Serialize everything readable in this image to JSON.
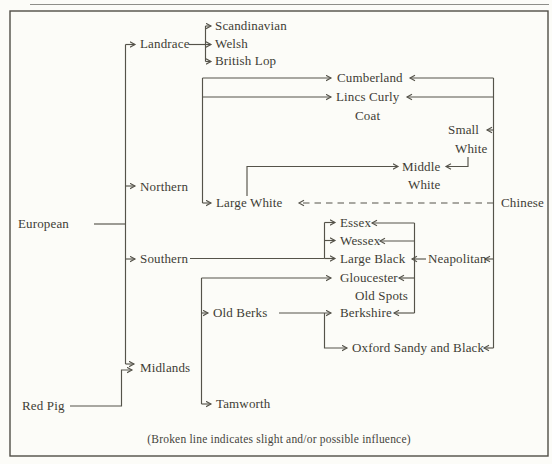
{
  "figure": {
    "caption": "(Broken line indicates slight and/or possible influence)",
    "background_color": "#fcfcf8",
    "ink_color": "#3e3d35",
    "line_color": "#55534a"
  },
  "nodes": {
    "european": {
      "label": "European"
    },
    "red_pig": {
      "label": "Red Pig"
    },
    "landrace": {
      "label": "Landrace"
    },
    "scandinavian": {
      "label": "Scandinavian"
    },
    "welsh": {
      "label": "Welsh"
    },
    "british_lop": {
      "label": "British Lop"
    },
    "northern": {
      "label": "Northern"
    },
    "southern": {
      "label": "Southern"
    },
    "midlands": {
      "label": "Midlands"
    },
    "cumberland": {
      "label": "Cumberland"
    },
    "lincs_curly_coat": {
      "line1": "Lincs Curly",
      "line2": "Coat"
    },
    "small_white": {
      "line1": "Small",
      "line2": "White"
    },
    "middle_white": {
      "line1": "Middle",
      "line2": "White"
    },
    "large_white": {
      "label": "Large White"
    },
    "chinese": {
      "label": "Chinese"
    },
    "essex": {
      "label": "Essex"
    },
    "wessex": {
      "label": "Wessex"
    },
    "large_black": {
      "label": "Large Black"
    },
    "neapolitan": {
      "label": "Neapolitan"
    },
    "gloucester_old_spots": {
      "line1": "Gloucester",
      "line2": "Old Spots"
    },
    "old_berks": {
      "label": "Old Berks"
    },
    "berkshire": {
      "label": "Berkshire"
    },
    "oxford_sandy_and_black": {
      "label": "Oxford Sandy and Black"
    },
    "tamworth": {
      "label": "Tamworth"
    }
  },
  "edges": [
    {
      "from": "european",
      "to": "landrace",
      "style": "solid"
    },
    {
      "from": "european",
      "to": "northern",
      "style": "solid"
    },
    {
      "from": "european",
      "to": "southern",
      "style": "solid"
    },
    {
      "from": "european",
      "to": "midlands",
      "style": "solid"
    },
    {
      "from": "red_pig",
      "to": "midlands",
      "style": "solid"
    },
    {
      "from": "landrace",
      "to": "scandinavian",
      "style": "solid"
    },
    {
      "from": "landrace",
      "to": "welsh",
      "style": "solid"
    },
    {
      "from": "landrace",
      "to": "british_lop",
      "style": "solid"
    },
    {
      "from": "northern",
      "to": "cumberland",
      "style": "solid"
    },
    {
      "from": "northern",
      "to": "lincs_curly_coat",
      "style": "solid"
    },
    {
      "from": "northern",
      "to": "large_white",
      "style": "solid"
    },
    {
      "from": "large_white",
      "to": "middle_white",
      "style": "solid"
    },
    {
      "from": "small_white",
      "to": "middle_white",
      "style": "solid"
    },
    {
      "from": "chinese",
      "to": "cumberland",
      "style": "solid"
    },
    {
      "from": "chinese",
      "to": "lincs_curly_coat",
      "style": "solid"
    },
    {
      "from": "chinese",
      "to": "small_white",
      "style": "solid"
    },
    {
      "from": "chinese",
      "to": "large_white",
      "style": "dashed"
    },
    {
      "from": "chinese",
      "to": "neapolitan",
      "style": "solid"
    },
    {
      "from": "chinese",
      "to": "oxford_sandy_and_black",
      "style": "solid"
    },
    {
      "from": "southern",
      "to": "essex",
      "style": "solid"
    },
    {
      "from": "southern",
      "to": "wessex",
      "style": "solid"
    },
    {
      "from": "southern",
      "to": "large_black",
      "style": "solid"
    },
    {
      "from": "neapolitan",
      "to": "essex",
      "style": "solid"
    },
    {
      "from": "neapolitan",
      "to": "wessex",
      "style": "solid"
    },
    {
      "from": "neapolitan",
      "to": "large_black",
      "style": "solid"
    },
    {
      "from": "neapolitan",
      "to": "gloucester_old_spots",
      "style": "solid"
    },
    {
      "from": "neapolitan",
      "to": "berkshire",
      "style": "solid"
    },
    {
      "from": "midlands",
      "to": "gloucester_old_spots",
      "style": "solid"
    },
    {
      "from": "midlands",
      "to": "old_berks",
      "style": "solid"
    },
    {
      "from": "midlands",
      "to": "tamworth",
      "style": "solid"
    },
    {
      "from": "old_berks",
      "to": "berkshire",
      "style": "solid"
    },
    {
      "from": "old_berks",
      "to": "oxford_sandy_and_black",
      "style": "solid"
    }
  ]
}
